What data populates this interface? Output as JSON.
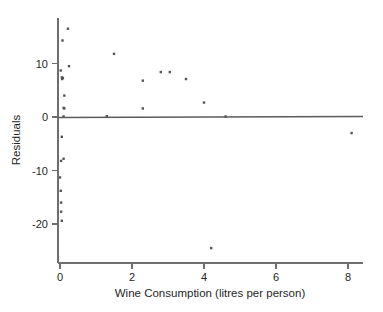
{
  "chart_data": {
    "type": "scatter",
    "title": "",
    "xlabel": "Wine Consumption (litres per person)",
    "ylabel": "Residuals",
    "xlim": [
      -0.35,
      8.6
    ],
    "ylim": [
      -26.5,
      18.5
    ],
    "xticks": [
      0,
      2,
      4,
      6,
      8
    ],
    "xticklabels": [
      "0",
      "2",
      "4",
      "6",
      "8"
    ],
    "yticks": [
      10,
      0,
      -10,
      -20
    ],
    "yticklabels": [
      "10",
      "0",
      "-10",
      "-20"
    ],
    "grid": false,
    "legend": "none",
    "reference_line": {
      "y": 0,
      "label": ""
    },
    "x": [
      0.22,
      0.07,
      0.25,
      0.02,
      0.05,
      0.06,
      0.08,
      0.12,
      0.1,
      0.12,
      0.1,
      1.5,
      2.3,
      2.8,
      3.05,
      3.5,
      2.3,
      4.0,
      1.3,
      4.6,
      0.05,
      0.1,
      0.03,
      0.0,
      0.02,
      0.03,
      0.03,
      0.05,
      4.2,
      8.1
    ],
    "y": [
      16.5,
      14.3,
      9.5,
      8.7,
      7.4,
      7.1,
      7.3,
      4.0,
      1.7,
      1.6,
      0.1,
      11.8,
      6.8,
      8.4,
      8.4,
      7.1,
      1.6,
      2.7,
      0.15,
      0.1,
      -3.7,
      -7.8,
      -8.2,
      -11.3,
      -13.8,
      -16.0,
      -17.7,
      -19.4,
      -24.5,
      -3.0
    ],
    "marker": "square",
    "marker_size": 2.4,
    "marker_color": "#555555",
    "n_points": 30
  },
  "axes": {
    "x_axis_title": "Wine Consumption (litres per person)",
    "y_axis_title": "Residuals"
  },
  "colors": {
    "marker": "#555555",
    "axis": "#6e6e6e",
    "reference_line": "#5a5a5a",
    "text": "#1f1f1f",
    "background": "#ffffff"
  }
}
